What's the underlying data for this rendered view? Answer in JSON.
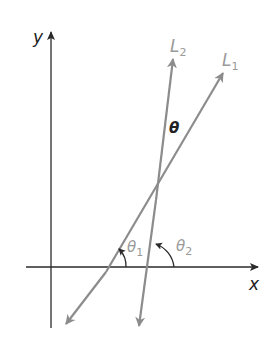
{
  "diagram": {
    "type": "coordinate-geometry",
    "axes": {
      "x_label": "x",
      "y_label": "y"
    },
    "lines": [
      {
        "name": "L1",
        "label": "L",
        "subscript": "1",
        "inclination_label": "θ",
        "inclination_subscript": "1"
      },
      {
        "name": "L2",
        "label": "L",
        "subscript": "2",
        "inclination_label": "θ",
        "inclination_subscript": "2"
      }
    ],
    "angle_between_label": "θ",
    "colors": {
      "axes": "#2a2a2a",
      "lines": "#8c8c8c",
      "labels_dark": "#222222",
      "labels_gray": "#9a9a9a"
    }
  }
}
